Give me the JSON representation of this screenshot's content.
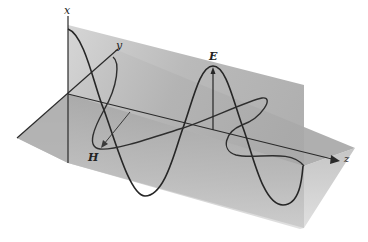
{
  "diagram": {
    "title": "",
    "axes": {
      "x_label": "x",
      "y_label": "y",
      "z_label": "z"
    },
    "fields": {
      "electric_label": "E",
      "magnetic_label": "H"
    },
    "colors": {
      "vertical_plane": "#b8b8b8",
      "horizontal_plane": "#c8c8c8",
      "curve": "#2a2a2a",
      "axis": "#2a2a2a",
      "background": "#ffffff"
    }
  }
}
